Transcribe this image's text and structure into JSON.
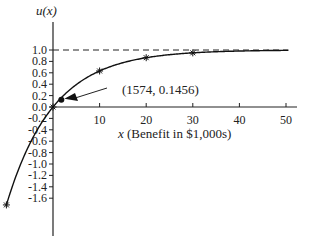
{
  "chart_data": {
    "type": "line",
    "title": "",
    "function": "u(x) = 1 - e^(-x/10)",
    "xlabel_var": "x",
    "xlabel_rest": " (Benefit in $1,000s)",
    "ylabel": "u(x)",
    "xlim": [
      -10,
      52
    ],
    "ylim": [
      -2.2,
      1.3
    ],
    "x_ticks": [
      10,
      20,
      30,
      40,
      50
    ],
    "x_tick_labels": [
      "10",
      "20",
      "30",
      "40",
      "50"
    ],
    "y_ticks": [
      1.0,
      0.8,
      0.6,
      0.4,
      0.2,
      0.0,
      -0.2,
      -0.4,
      -0.6,
      -0.8,
      -1.0,
      -1.2,
      -1.4,
      -1.6
    ],
    "y_tick_labels": [
      "1.0",
      "0.8",
      "0.6",
      "0.4",
      "0.2",
      "0.0",
      "-0.2",
      "-0.4",
      "-0.6",
      "-0.8",
      "-1.0",
      "-1.2",
      "-1.4",
      "-1.6"
    ],
    "asymptote": {
      "y": 1.0,
      "style": "dashed"
    },
    "series": [
      {
        "name": "u(x)",
        "marked_points": [
          {
            "x": -10,
            "y": -1.718
          },
          {
            "x": 0,
            "y": 0.0
          },
          {
            "x": 10,
            "y": 0.632
          },
          {
            "x": 20,
            "y": 0.865
          },
          {
            "x": 30,
            "y": 0.95
          }
        ]
      }
    ],
    "annotation": {
      "label": "(1574, 0.1456)",
      "point": {
        "x": 1.574,
        "y": 0.1456
      },
      "arrow": true
    },
    "grid": false,
    "legend": null
  }
}
